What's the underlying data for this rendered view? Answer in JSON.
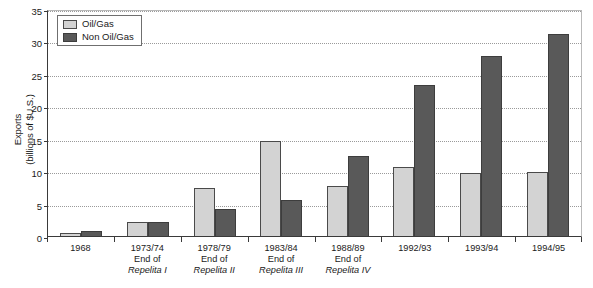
{
  "chart_data": {
    "type": "bar",
    "title": "",
    "xlabel": "",
    "ylabel": "Exports (billions of $U.S.)",
    "ylabel_lines": [
      "Exports",
      "(billions of $U.S.)"
    ],
    "ylim": [
      0,
      35
    ],
    "yticks": [
      0,
      5,
      10,
      15,
      20,
      25,
      30,
      35
    ],
    "ytick_labels": [
      "0",
      "5",
      "10",
      "15",
      "20",
      "25",
      "30",
      "35"
    ],
    "grid": true,
    "grid_style": "dotted",
    "legend_position": "top-left",
    "categories": [
      "1968",
      "1973/74",
      "1978/79",
      "1983/84",
      "1988/89",
      "1992/93",
      "1993/94",
      "1994/95"
    ],
    "category_labels": [
      {
        "year": "1968",
        "line2": "",
        "line3": ""
      },
      {
        "year": "1973/74",
        "line2": "End of",
        "line3": "Repelita I"
      },
      {
        "year": "1978/79",
        "line2": "End of",
        "line3": "Repelita II"
      },
      {
        "year": "1983/84",
        "line2": "End of",
        "line3": "Repelita III"
      },
      {
        "year": "1988/89",
        "line2": "End of",
        "line3": "Repelita IV"
      },
      {
        "year": "1992/93",
        "line2": "",
        "line3": ""
      },
      {
        "year": "1993/94",
        "line2": "",
        "line3": ""
      },
      {
        "year": "1994/95",
        "line2": "",
        "line3": ""
      }
    ],
    "series": [
      {
        "name": "Oil/Gas",
        "color": "#d3d3d3",
        "values": [
          0.4,
          2.1,
          7.4,
          14.6,
          7.7,
          10.6,
          9.7,
          9.9
        ]
      },
      {
        "name": "Non Oil/Gas",
        "color": "#595959",
        "values": [
          0.7,
          2.2,
          4.2,
          5.5,
          12.3,
          23.3,
          27.8,
          31.2
        ]
      }
    ]
  },
  "legend": {
    "entries": [
      {
        "label": "Oil/Gas"
      },
      {
        "label": "Non Oil/Gas"
      }
    ]
  },
  "caption": {
    "clipped_text": ""
  }
}
